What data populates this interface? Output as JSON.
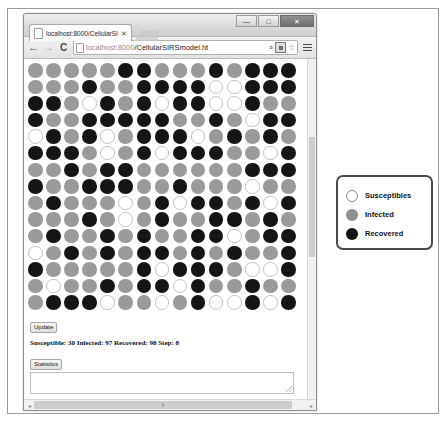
{
  "window": {
    "controls": {
      "minimize_label": "—",
      "maximize_label": "□",
      "close_label": "✕"
    }
  },
  "browser": {
    "tab": {
      "title": "localhost:8000/CellularSI",
      "close_label": "✕"
    },
    "toolbar": {
      "back_label": "←",
      "forward_label": "→",
      "reload_label": "C",
      "url_host": "localhost:8000",
      "url_path": "/CellularSIRSmodel.ht",
      "search_icon_label": "⌕",
      "star_label": "☆"
    }
  },
  "page": {
    "update_button": "Update",
    "status_text": "Susceptible: 30 Infected: 97 Recovered: 98 Step: 8",
    "statistics_button": "Statistics",
    "textarea_value": "",
    "scrollbar": {
      "left_arrow": "◂",
      "right_arrow": "▸",
      "thumb_grip": "‖"
    }
  },
  "legend": {
    "items": [
      {
        "label": "Susceptibles",
        "state": "S",
        "color": "#ffffff"
      },
      {
        "label": "Infected",
        "state": "I",
        "color": "#8f8f8f"
      },
      {
        "label": "Recovered",
        "state": "R",
        "color": "#121212"
      }
    ]
  },
  "simulation": {
    "columns": 15,
    "rows": 15,
    "counts": {
      "susceptible": 30,
      "infected": 97,
      "recovered": 98,
      "step": 8
    },
    "state_colors": {
      "S": "#ffffff",
      "I": "#9a9a9a",
      "R": "#151515"
    },
    "grid": [
      [
        "I",
        "I",
        "I",
        "I",
        "I",
        "R",
        "R",
        "I",
        "I",
        "I",
        "R",
        "I",
        "R",
        "R",
        "R"
      ],
      [
        "I",
        "I",
        "I",
        "R",
        "I",
        "I",
        "R",
        "R",
        "R",
        "R",
        "S",
        "S",
        "R",
        "R",
        "R"
      ],
      [
        "R",
        "R",
        "I",
        "S",
        "R",
        "I",
        "R",
        "S",
        "R",
        "R",
        "S",
        "S",
        "R",
        "I",
        "I"
      ],
      [
        "R",
        "I",
        "I",
        "R",
        "R",
        "R",
        "R",
        "R",
        "I",
        "I",
        "R",
        "I",
        "S",
        "R",
        "R"
      ],
      [
        "S",
        "R",
        "I",
        "R",
        "S",
        "I",
        "R",
        "R",
        "R",
        "S",
        "I",
        "R",
        "I",
        "R",
        "I"
      ],
      [
        "R",
        "R",
        "R",
        "I",
        "S",
        "I",
        "R",
        "S",
        "R",
        "R",
        "R",
        "I",
        "I",
        "S",
        "R"
      ],
      [
        "I",
        "I",
        "R",
        "I",
        "R",
        "R",
        "I",
        "I",
        "I",
        "I",
        "I",
        "I",
        "R",
        "R",
        "R"
      ],
      [
        "R",
        "I",
        "I",
        "R",
        "R",
        "R",
        "I",
        "I",
        "R",
        "I",
        "I",
        "I",
        "S",
        "I",
        "I"
      ],
      [
        "I",
        "R",
        "I",
        "I",
        "I",
        "S",
        "I",
        "R",
        "S",
        "R",
        "R",
        "I",
        "R",
        "S",
        "R"
      ],
      [
        "I",
        "I",
        "I",
        "R",
        "I",
        "S",
        "I",
        "R",
        "I",
        "I",
        "R",
        "R",
        "I",
        "R",
        "I"
      ],
      [
        "I",
        "R",
        "I",
        "I",
        "R",
        "I",
        "R",
        "I",
        "I",
        "R",
        "R",
        "S",
        "I",
        "R",
        "R"
      ],
      [
        "S",
        "I",
        "R",
        "I",
        "R",
        "I",
        "R",
        "R",
        "I",
        "R",
        "I",
        "R",
        "I",
        "I",
        "R"
      ],
      [
        "R",
        "I",
        "I",
        "I",
        "I",
        "I",
        "R",
        "S",
        "R",
        "R",
        "R",
        "I",
        "S",
        "S",
        "R"
      ],
      [
        "I",
        "S",
        "I",
        "I",
        "R",
        "I",
        "R",
        "R",
        "S",
        "R",
        "I",
        "I",
        "R",
        "I",
        "I"
      ],
      [
        "I",
        "R",
        "R",
        "R",
        "S",
        "I",
        "I",
        "S",
        "I",
        "R",
        "S",
        "S",
        "R",
        "S",
        "R"
      ]
    ]
  }
}
